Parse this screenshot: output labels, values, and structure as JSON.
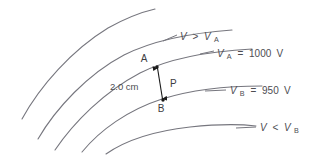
{
  "diagram": {
    "background_color": "#ffffff",
    "curve_color": "#76767e",
    "text_color": "#4d4d52",
    "marker_color": "#1a1a1a",
    "labels": {
      "above_a": {
        "v": "V",
        "relation": ">",
        "v2": "V",
        "v2_sub": "A",
        "full": "V > VA"
      },
      "surface_a": {
        "v": "V",
        "sub": "A",
        "equals": "=",
        "value": "1000",
        "unit": "V",
        "full": "VA = 1000 V"
      },
      "surface_b": {
        "v": "V",
        "sub": "B",
        "equals": "=",
        "value": "950",
        "unit": "V",
        "full": "VB = 950 V"
      },
      "below_b": {
        "v": "V",
        "relation": "<",
        "v2": "V",
        "v2_sub": "B",
        "full": "V < VB"
      }
    },
    "points": {
      "a": "A",
      "b": "B",
      "p": "P"
    },
    "separation": {
      "value": "2.0",
      "unit": "cm",
      "full": "2.0 cm"
    }
  }
}
